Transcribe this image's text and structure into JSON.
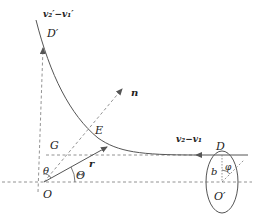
{
  "diagram": {
    "type": "physics-scattering-geometry",
    "labels": {
      "outgoing_velocity": "v₂′−v₁′",
      "point_d_prime": "D′",
      "normal": "n",
      "point_e": "E",
      "point_g": "G",
      "position_vector": "r",
      "incoming_velocity": "v₂−v₁",
      "point_d": "D",
      "angle_theta_small": "θ",
      "angle_theta_big": "Θ",
      "origin": "O",
      "impact_parameter": "b",
      "angle_phi": "φ",
      "origin_prime": "O′"
    },
    "colors": {
      "line": "#555555",
      "dashed": "#777777",
      "text": "#222222",
      "background": "#ffffff"
    }
  }
}
